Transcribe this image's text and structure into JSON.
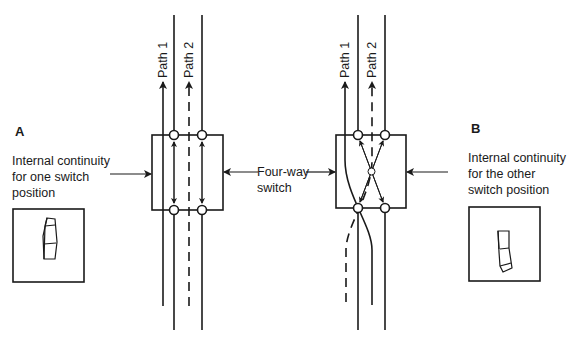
{
  "panel_a": {
    "letter": "A",
    "caption_lines": [
      "Internal continuity",
      "for one switch",
      "position"
    ]
  },
  "panel_b": {
    "letter": "B",
    "caption_lines": [
      "Internal continuity",
      "for the other",
      "switch position"
    ]
  },
  "center_label": {
    "lines": [
      "Four-way",
      "switch"
    ]
  },
  "paths": {
    "path1": "Path 1",
    "path2": "Path 2"
  },
  "colors": {
    "stroke": "#1a1a1a",
    "background": "#ffffff"
  }
}
